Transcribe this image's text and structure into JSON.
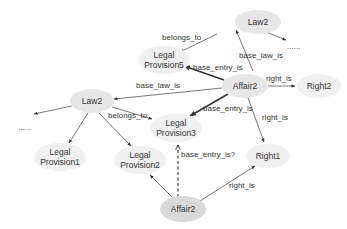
{
  "diagram": {
    "nodes": [
      {
        "id": "law2_top",
        "lines": [
          "Law2"
        ],
        "cx": 258,
        "cy": 22,
        "rx": 23,
        "ry": 12,
        "shade": "normal"
      },
      {
        "id": "lp5",
        "lines": [
          "Legal",
          "Provision5"
        ],
        "cx": 164,
        "cy": 60,
        "rx": 26,
        "ry": 14,
        "shade": "light"
      },
      {
        "id": "affair2_mid",
        "lines": [
          "Affair2"
        ],
        "cx": 245,
        "cy": 86,
        "rx": 23,
        "ry": 12,
        "shade": "normal"
      },
      {
        "id": "right2",
        "lines": [
          "Right2"
        ],
        "cx": 319,
        "cy": 86,
        "rx": 22,
        "ry": 12,
        "shade": "light"
      },
      {
        "id": "law2_left",
        "lines": [
          "Law2"
        ],
        "cx": 92,
        "cy": 101,
        "rx": 22,
        "ry": 12,
        "shade": "normal"
      },
      {
        "id": "lp3",
        "lines": [
          "Legal",
          "Provision3"
        ],
        "cx": 176,
        "cy": 128,
        "rx": 26,
        "ry": 14,
        "shade": "light"
      },
      {
        "id": "lp1",
        "lines": [
          "Legal",
          "Provision1"
        ],
        "cx": 60,
        "cy": 157,
        "rx": 26,
        "ry": 14,
        "shade": "light"
      },
      {
        "id": "lp2",
        "lines": [
          "Legal",
          "Provision2"
        ],
        "cx": 140,
        "cy": 160,
        "rx": 26,
        "ry": 14,
        "shade": "light"
      },
      {
        "id": "right1",
        "lines": [
          "Right1"
        ],
        "cx": 268,
        "cy": 156,
        "rx": 22,
        "ry": 12,
        "shade": "light"
      },
      {
        "id": "affair2_bottom",
        "lines": [
          "Affair2"
        ],
        "cx": 183,
        "cy": 209,
        "rx": 23,
        "ry": 13,
        "shade": "dark"
      }
    ],
    "edges": [
      {
        "from": [
          217,
          34
        ],
        "to": [
          180,
          52
        ],
        "style": "normal",
        "label": "belongs_to",
        "lx": 162,
        "ly": 40
      },
      {
        "from": [
          253,
          71
        ],
        "to": [
          236,
          30
        ],
        "style": "normal",
        "label": "base_law_is",
        "lx": 239,
        "ly": 58
      },
      {
        "from": [
          256,
          28
        ],
        "to": [
          286,
          40
        ],
        "style": "normal",
        "label": "",
        "lx": 0,
        "ly": 0
      },
      {
        "from": [
          224,
          80
        ],
        "to": [
          184,
          66
        ],
        "style": "bold",
        "label": "base_entry_is",
        "lx": 193,
        "ly": 70
      },
      {
        "from": [
          268,
          86
        ],
        "to": [
          295,
          86
        ],
        "style": "normal",
        "label": "right_is",
        "lx": 266,
        "ly": 81
      },
      {
        "from": [
          222,
          88
        ],
        "to": [
          114,
          99
        ],
        "style": "normal",
        "label": "base_law_is",
        "lx": 136,
        "ly": 88
      },
      {
        "from": [
          228,
          94
        ],
        "to": [
          190,
          116
        ],
        "style": "bold",
        "label": "base_entry_is",
        "lx": 203,
        "ly": 111
      },
      {
        "from": [
          248,
          98
        ],
        "to": [
          264,
          142
        ],
        "style": "normal",
        "label": "right_is",
        "lx": 262,
        "ly": 120
      },
      {
        "from": [
          72,
          106
        ],
        "to": [
          34,
          114
        ],
        "style": "normal",
        "label": "",
        "lx": 0,
        "ly": 0
      },
      {
        "from": [
          88,
          113
        ],
        "to": [
          69,
          143
        ],
        "style": "normal",
        "label": "",
        "lx": 0,
        "ly": 0
      },
      {
        "from": [
          112,
          107
        ],
        "to": [
          152,
          119
        ],
        "style": "normal",
        "label": "belongs_to",
        "lx": 108,
        "ly": 118
      },
      {
        "from": [
          99,
          113
        ],
        "to": [
          131,
          146
        ],
        "style": "normal",
        "label": "",
        "lx": 0,
        "ly": 0
      },
      {
        "from": [
          178,
          197
        ],
        "to": [
          178,
          145
        ],
        "style": "dashed",
        "label": "base_entry_is?",
        "lx": 181,
        "ly": 157
      },
      {
        "from": [
          172,
          197
        ],
        "to": [
          150,
          175
        ],
        "style": "normal",
        "label": "",
        "lx": 0,
        "ly": 0
      },
      {
        "from": [
          200,
          201
        ],
        "to": [
          255,
          166
        ],
        "style": "normal",
        "label": "right_is",
        "lx": 229,
        "ly": 188
      }
    ],
    "ellipsis_marks": [
      {
        "text": "......",
        "x": 287,
        "y": 49
      },
      {
        "text": "......",
        "x": 18,
        "y": 130
      }
    ]
  }
}
